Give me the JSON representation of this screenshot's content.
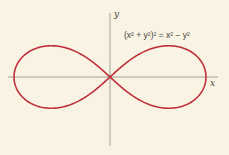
{
  "figure": {
    "equation": "(x² + y²)² = x² − y²",
    "x_label": "x",
    "y_label": "y",
    "curve_name": "lemniscate",
    "curve_color": "#c0303a",
    "axis_color": "#7a7a7a",
    "background": "#f8f3e3"
  }
}
